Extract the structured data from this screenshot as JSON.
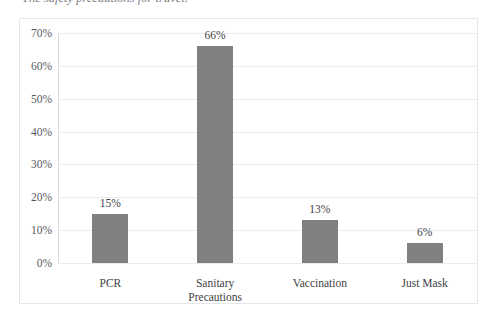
{
  "caption": {
    "text": "The safety precautions for travel."
  },
  "chart_data": {
    "type": "bar",
    "title": "",
    "xlabel": "",
    "ylabel": "",
    "categories": [
      "PCR",
      "Sanitary\nPrecautions",
      "Vaccination",
      "Just Mask"
    ],
    "values": [
      15,
      66,
      13,
      6
    ],
    "data_labels": [
      "15%",
      "66%",
      "13%",
      "6%"
    ],
    "ylim": [
      0,
      70
    ],
    "yticks": [
      0,
      10,
      20,
      30,
      40,
      50,
      60,
      70
    ],
    "ytick_labels": [
      "0%",
      "10%",
      "20%",
      "30%",
      "40%",
      "50%",
      "60%",
      "70%"
    ],
    "grid": true,
    "legend": false,
    "bar_color": "#808080",
    "gridline_color": "#ececed",
    "frame_color": "#e6e6ea"
  }
}
